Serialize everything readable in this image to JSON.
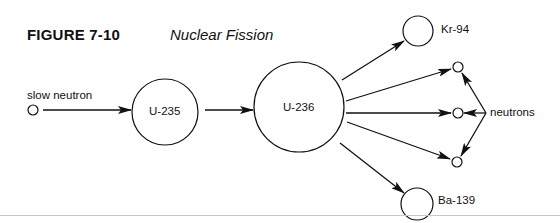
{
  "figure": {
    "number": "FIGURE 7-10",
    "title": "Nuclear Fission"
  },
  "labels": {
    "slow_neutron": "slow neutron",
    "u235": "U-235",
    "u236": "U-236",
    "kr94": "Kr-94",
    "ba139": "Ba-139",
    "neutrons": "neutrons"
  },
  "colors": {
    "stroke": "#111111",
    "rule": "#c8c8c8",
    "background": "#ffffff"
  },
  "nodes": [
    {
      "id": "slow-neutron",
      "label": "slow neutron",
      "cx": 33,
      "cy": 110,
      "r": 5
    },
    {
      "id": "u235",
      "label": "U-235",
      "cx": 165,
      "cy": 112,
      "r": 33
    },
    {
      "id": "u236",
      "label": "U-236",
      "cx": 299,
      "cy": 107,
      "r": 45
    },
    {
      "id": "kr94",
      "label": "Kr-94",
      "cx": 418,
      "cy": 31,
      "r": 15
    },
    {
      "id": "neutron-1",
      "label": "",
      "cx": 458,
      "cy": 67,
      "r": 5
    },
    {
      "id": "neutron-2",
      "label": "",
      "cx": 458,
      "cy": 113,
      "r": 5
    },
    {
      "id": "neutron-3",
      "label": "",
      "cx": 457,
      "cy": 162,
      "r": 5
    },
    {
      "id": "ba139",
      "label": "Ba-139",
      "cx": 417,
      "cy": 204,
      "r": 16
    }
  ],
  "edges": [
    {
      "from": "slow-neutron",
      "to": "u235"
    },
    {
      "from": "u235",
      "to": "u236"
    },
    {
      "from": "u236",
      "to": "kr94"
    },
    {
      "from": "u236",
      "to": "neutron-1"
    },
    {
      "from": "u236",
      "to": "neutron-2"
    },
    {
      "from": "u236",
      "to": "neutron-3"
    },
    {
      "from": "u236",
      "to": "ba139"
    },
    {
      "from": "neutrons-label",
      "to": "neutron-1"
    },
    {
      "from": "neutrons-label",
      "to": "neutron-2"
    },
    {
      "from": "neutrons-label",
      "to": "neutron-3"
    }
  ]
}
